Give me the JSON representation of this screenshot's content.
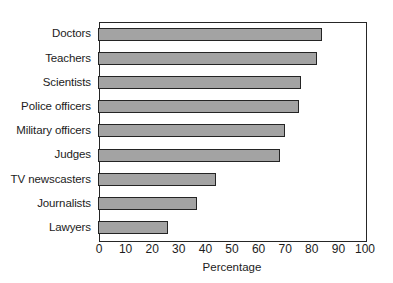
{
  "chart_data": {
    "type": "bar",
    "orientation": "horizontal",
    "title": "",
    "xlabel": "Percentage",
    "ylabel": "",
    "xlim": [
      0,
      100
    ],
    "xticks": [
      0,
      10,
      20,
      30,
      40,
      50,
      60,
      70,
      80,
      90,
      100
    ],
    "grid": false,
    "legend": null,
    "categories": [
      "Doctors",
      "Teachers",
      "Scientists",
      "Police officers",
      "Military officers",
      "Judges",
      "TV newscasters",
      "Journalists",
      "Lawyers"
    ],
    "values": [
      84,
      82,
      76,
      75,
      70,
      68,
      44,
      37,
      26
    ],
    "bar_fill_color": "#a3a3a3",
    "bar_edge_color": "#242424",
    "background_color": "#ffffff",
    "axis_color": "#262626"
  }
}
